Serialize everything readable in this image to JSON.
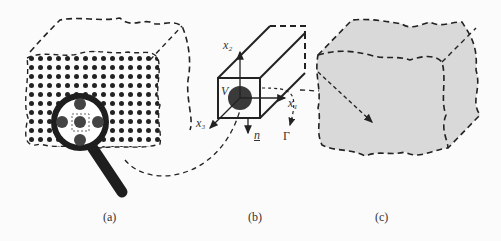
{
  "figure": {
    "panels": [
      {
        "id": "a",
        "caption": "(a)",
        "description": "Macroscopic body with periodic microstructure, magnifier highlighting a unit cell"
      },
      {
        "id": "b",
        "caption": "(b)",
        "description": "Representative volume element with inclusion"
      },
      {
        "id": "c",
        "caption": "(c)",
        "description": "Homogenized macroscopic body"
      }
    ],
    "rve_labels": {
      "x1": "x₁",
      "x2": "x₂",
      "x3": "x₃",
      "volume": "V",
      "normal": "n",
      "boundary": "Γ"
    },
    "colors": {
      "ink": "#222222",
      "fill_homogenized": "#d9d9d9",
      "inclusion": "#3a3a3a",
      "background": "#fbfbfb"
    }
  }
}
